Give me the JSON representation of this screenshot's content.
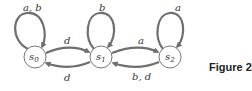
{
  "figure": {
    "caption": "Figure 2",
    "type": "state-transition-diagram"
  },
  "states": [
    {
      "id": "s0",
      "name": "s",
      "sub": "0"
    },
    {
      "id": "s1",
      "name": "s",
      "sub": "1"
    },
    {
      "id": "s2",
      "name": "s",
      "sub": "2"
    }
  ],
  "transitions": [
    {
      "from": "s0",
      "to": "s0",
      "label": "a, b"
    },
    {
      "from": "s0",
      "to": "s1",
      "label": "d"
    },
    {
      "from": "s1",
      "to": "s0",
      "label": "d"
    },
    {
      "from": "s1",
      "to": "s1",
      "label": "b"
    },
    {
      "from": "s1",
      "to": "s2",
      "label": "a"
    },
    {
      "from": "s2",
      "to": "s1",
      "label": "b, d"
    },
    {
      "from": "s2",
      "to": "s2",
      "label": "a"
    }
  ],
  "colors": {
    "edge": "#6f6f6f",
    "node_stroke": "#777777",
    "text": "#333333"
  }
}
